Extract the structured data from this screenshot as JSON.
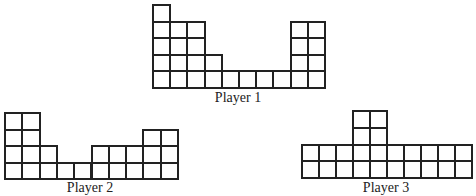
{
  "players": [
    {
      "label": "Player 1",
      "heights": [
        5,
        4,
        4,
        2,
        1,
        1,
        1,
        1,
        4,
        4
      ],
      "grid": {
        "left": 152,
        "bottom": 87,
        "cell_w": 17.2,
        "cell_h": 16.6
      },
      "label_pos": {
        "x": 238,
        "y": 90
      }
    },
    {
      "label": "Player 2",
      "heights": [
        4,
        4,
        2,
        1,
        1,
        2,
        2,
        2,
        3,
        3
      ],
      "grid": {
        "left": 4,
        "bottom": 178,
        "cell_w": 17.3,
        "cell_h": 16.5
      },
      "label_pos": {
        "x": 90,
        "y": 180
      }
    },
    {
      "label": "Player 3",
      "heights": [
        2,
        2,
        2,
        4,
        4,
        2,
        2,
        2,
        2,
        2
      ],
      "grid": {
        "left": 301,
        "bottom": 177,
        "cell_w": 17.0,
        "cell_h": 16.7
      },
      "label_pos": {
        "x": 386,
        "y": 180
      }
    }
  ]
}
